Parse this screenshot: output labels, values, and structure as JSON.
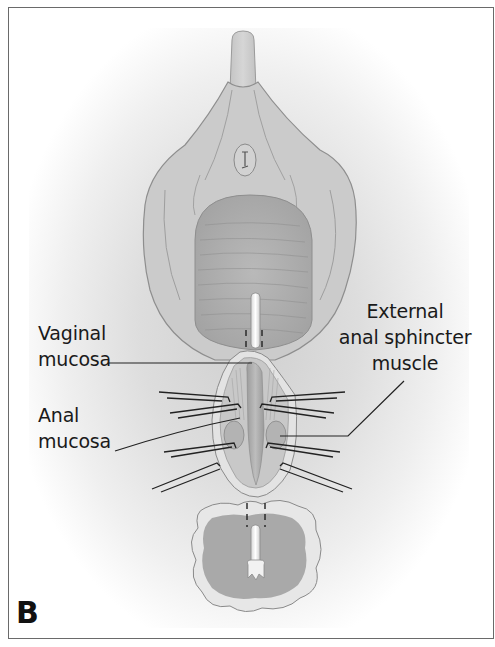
{
  "figure": {
    "panel_letter": "B",
    "labels": {
      "vaginal_mucosa": [
        "Vaginal",
        "mucosa"
      ],
      "anal_mucosa": [
        "Anal",
        "mucosa"
      ],
      "external_anal_sphincter": [
        "External",
        "anal sphincter",
        "muscle"
      ]
    },
    "colors": {
      "tissue": "#cdcdcd",
      "tissue_dark": "#a8a8a8",
      "outline": "#8c8c8c",
      "suture": "#222222",
      "text": "#1a1a1a",
      "frame": "#6a6a6a"
    }
  }
}
